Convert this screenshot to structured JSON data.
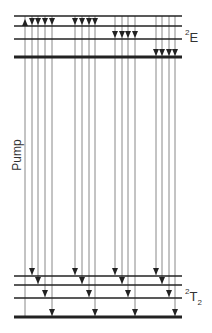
{
  "labels": {
    "upper_state": {
      "sup": "2",
      "main": "E",
      "sub": ""
    },
    "lower_state": {
      "sup": "2",
      "main": "T",
      "sub": "2"
    },
    "pump": "Pump"
  },
  "colors": {
    "line": "#222222",
    "arrow": "#888888",
    "head": "#222222"
  },
  "levels": {
    "x_start": 14,
    "x_end": 182,
    "upper": [
      {
        "y": 16,
        "width": 1.5
      },
      {
        "y": 26,
        "width": 1.5
      },
      {
        "y": 39,
        "width": 1.5
      },
      {
        "y": 57,
        "width": 3
      }
    ],
    "lower": [
      {
        "y": 276,
        "width": 1.5
      },
      {
        "y": 285,
        "width": 1.5
      },
      {
        "y": 298,
        "width": 1.5
      },
      {
        "y": 317,
        "width": 3
      }
    ]
  },
  "groups": [
    {
      "xs": [
        32,
        38,
        45,
        52
      ],
      "from_upper": 1
    },
    {
      "xs": [
        75,
        82,
        89,
        95
      ],
      "from_upper": 0
    },
    {
      "xs": [
        115,
        122,
        128,
        135
      ],
      "from_upper": 2
    },
    {
      "xs": [
        156,
        162,
        169,
        175
      ],
      "from_upper": 3
    }
  ],
  "pump_arrow": {
    "x": 25,
    "from_lower": 3,
    "to_upper": 1
  }
}
